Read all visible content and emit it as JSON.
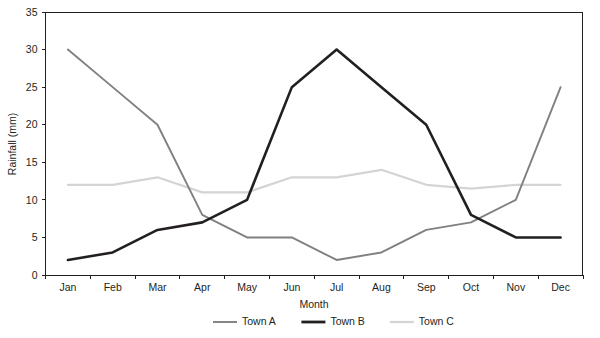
{
  "chart_data": {
    "type": "line",
    "title": "",
    "xlabel": "Month",
    "ylabel": "Rainfall (mm)",
    "categories": [
      "Jan",
      "Feb",
      "Mar",
      "Apr",
      "May",
      "Jun",
      "Jul",
      "Aug",
      "Sep",
      "Oct",
      "Nov",
      "Dec"
    ],
    "ylim": [
      0,
      35
    ],
    "yticks": [
      0,
      5,
      10,
      15,
      20,
      25,
      30,
      35
    ],
    "grid": false,
    "legend_position": "bottom",
    "series": [
      {
        "name": "Town A",
        "color": "#808080",
        "width": 1.9,
        "values": [
          30,
          25,
          20,
          8,
          5,
          5,
          2,
          3,
          6,
          7,
          10,
          25
        ]
      },
      {
        "name": "Town B",
        "color": "#231f20",
        "width": 2.6,
        "values": [
          2,
          3,
          6,
          7,
          10,
          25,
          30,
          25,
          20,
          8,
          5,
          5
        ]
      },
      {
        "name": "Town C",
        "color": "#d4d4d4",
        "width": 2.2,
        "values": [
          12,
          12,
          13,
          11,
          11,
          13,
          13,
          14,
          12,
          11.5,
          12,
          12
        ]
      }
    ]
  },
  "axis": {
    "y_tick_labels": [
      "0",
      "5",
      "10",
      "15",
      "20",
      "25",
      "30",
      "35"
    ],
    "x_tick_labels": [
      "Jan",
      "Feb",
      "Mar",
      "Apr",
      "May",
      "Jun",
      "Jul",
      "Aug",
      "Sep",
      "Oct",
      "Nov",
      "Dec"
    ],
    "y_title": "Rainfall (mm)",
    "x_title": "Month"
  },
  "legend": {
    "items": [
      {
        "label": "Town A",
        "color": "#808080",
        "width": 1.9
      },
      {
        "label": "Town B",
        "color": "#231f20",
        "width": 2.8
      },
      {
        "label": "Town C",
        "color": "#d4d4d4",
        "width": 2.2
      }
    ]
  }
}
